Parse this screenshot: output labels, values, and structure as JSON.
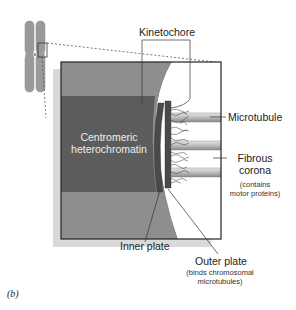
{
  "figure": {
    "panel_label": "(b)",
    "labels": {
      "kinetochore": "Kinetochore",
      "microtubule": "Microtubule",
      "fibrous_corona": "Fibrous",
      "fibrous_corona_2": "corona",
      "fibrous_corona_note": "(contains",
      "fibrous_corona_note_2": "motor proteins)",
      "centromeric": "Centromeric",
      "heterochromatin": "heterochromatin",
      "inner_plate": "Inner plate",
      "outer_plate": "Outer plate",
      "outer_plate_note": "(binds chromosomal",
      "outer_plate_note_2": "microtubules)"
    },
    "colors": {
      "chromosome": "#9a9a9a",
      "light_chromatin": "#8e8e8e",
      "dark_chromatin": "#5c5c5c",
      "plate": "#4a4a4a",
      "shadow": "#d9d9d9",
      "microtubule": "#b8b8b8"
    }
  }
}
